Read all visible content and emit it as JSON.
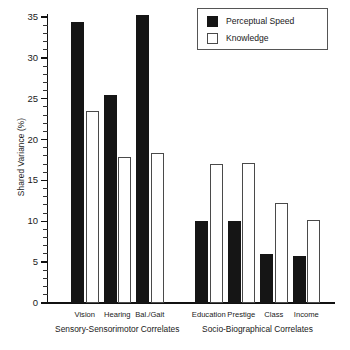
{
  "chart_data": {
    "type": "bar",
    "title": "",
    "xlabel": "",
    "ylabel": "Shared Variance (%)",
    "ylim": [
      0,
      36.5
    ],
    "ytick_values": [
      0,
      5,
      10,
      15,
      20,
      25,
      30,
      35
    ],
    "ytick_labels": [
      "0",
      "5",
      "10",
      "15",
      "20",
      "25",
      "30",
      "35"
    ],
    "yminor_step": 1,
    "grid": false,
    "legend_position": "top-right",
    "categories": [
      "Vision",
      "Hearing",
      "Bal./Gait",
      "Education",
      "Prestige",
      "Class",
      "Income"
    ],
    "groups": [
      {
        "label": "Sensory-Sensorimotor Correlates",
        "categories": [
          "Vision",
          "Hearing",
          "Bal./Gait"
        ]
      },
      {
        "label": "Socio-Biographical Correlates",
        "categories": [
          "Education",
          "Prestige",
          "Class",
          "Income"
        ]
      }
    ],
    "series": [
      {
        "name": "Perceptual Speed",
        "color": "#151515",
        "values": [
          34.4,
          25.4,
          35.2,
          10.0,
          10.0,
          6.0,
          5.8
        ]
      },
      {
        "name": "Knowledge",
        "color": "#ffffff",
        "values": [
          23.5,
          17.9,
          18.3,
          17.0,
          17.1,
          12.3,
          10.2
        ]
      }
    ]
  },
  "legend": {
    "items": [
      {
        "label": "Perceptual Speed",
        "swatch": "dark"
      },
      {
        "label": "Knowledge",
        "swatch": "light"
      }
    ]
  },
  "axis": {
    "y_title": "Shared Variance (%)"
  }
}
